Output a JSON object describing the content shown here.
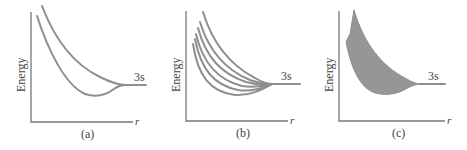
{
  "figure": {
    "panels": [
      {
        "id": "a",
        "caption": "(a)",
        "y_label": "Energy",
        "x_label": "r",
        "level_label": "3s",
        "description": "Two energy curves vs r converging to the 3s level"
      },
      {
        "id": "b",
        "caption": "(b)",
        "y_label": "Energy",
        "x_label": "r",
        "level_label": "3s",
        "description": "Six energy curves vs r converging to the 3s level"
      },
      {
        "id": "c",
        "caption": "(c)",
        "y_label": "Energy",
        "x_label": "r",
        "level_label": "3s",
        "description": "Shaded band (energy band) converging to the 3s level"
      }
    ],
    "colors": {
      "curve": "#8e8e8e",
      "band_fill": "#969696",
      "axis": "#777777",
      "text": "#444444"
    }
  }
}
